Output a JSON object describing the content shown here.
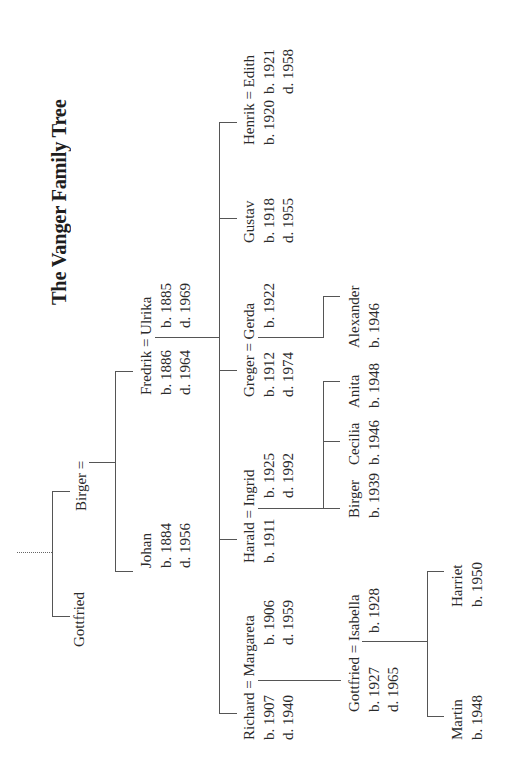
{
  "title": "The Vanger Family Tree",
  "tree": {
    "gen0": {
      "gottfried": {
        "name": "Gottfried"
      },
      "birger": {
        "name": "Birger ="
      }
    },
    "gen1": {
      "johan": {
        "name": "Johan",
        "born": "b. 1884",
        "died": "d. 1956"
      },
      "fredrik": {
        "name": "Fredrik = Ulrika",
        "born": "b. 1886",
        "died": "d. 1964",
        "spouse": {
          "name": "Ulrika",
          "born": "b. 1885",
          "died": "d. 1969"
        }
      }
    },
    "gen2": {
      "richard": {
        "name": "Richard = Margareta",
        "born": "b. 1907",
        "died": "d. 1940",
        "spouse": {
          "name": "Margareta",
          "born": "b. 1906",
          "died": "d. 1959"
        }
      },
      "harald": {
        "name": "Harald = Ingrid",
        "born": "b. 1911",
        "spouse": {
          "name": "Ingrid",
          "born": "b. 1925",
          "died": "d. 1992"
        }
      },
      "greger": {
        "name": "Greger = Gerda",
        "born": "b. 1912",
        "died": "d. 1974",
        "spouse": {
          "name": "Gerda",
          "born": "b. 1922"
        }
      },
      "gustav": {
        "name": "Gustav",
        "born": "b. 1918",
        "died": "d. 1955"
      },
      "henrik": {
        "name": "Henrik = Edith",
        "born": "b. 1920",
        "spouse": {
          "name": "Edith",
          "born": "b. 1921",
          "died": "d. 1958"
        }
      }
    },
    "gen3": {
      "gottfried": {
        "name": "Gottfried = Isabella",
        "born": "b. 1927",
        "died": "d. 1965",
        "spouse": {
          "name": "Isabella",
          "born": "b. 1928"
        }
      },
      "birger": {
        "name": "Birger",
        "born": "b. 1939"
      },
      "cecilia": {
        "name": "Cecilia",
        "born": "b. 1946"
      },
      "anita": {
        "name": "Anita",
        "born": "b. 1948"
      },
      "alexander": {
        "name": "Alexander",
        "born": "b. 1946"
      }
    },
    "gen4": {
      "martin": {
        "name": "Martin",
        "born": "b. 1948"
      },
      "harriet": {
        "name": "Harriet",
        "born": "b. 1950"
      }
    }
  },
  "colors": {
    "line": "#555555",
    "text": "#2a2a2a",
    "background": "#ffffff"
  }
}
